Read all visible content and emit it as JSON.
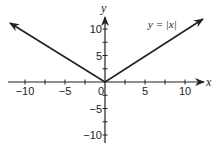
{
  "chart_data": {
    "type": "line",
    "title": "",
    "function_label": "y = |x|",
    "xlabel": "x",
    "ylabel": "y",
    "xlim": [
      -11.5,
      11.5
    ],
    "ylim": [
      -11,
      12.5
    ],
    "x_ticks": [
      -10,
      -7.5,
      -5,
      -2.5,
      0,
      2.5,
      5,
      7.5,
      10
    ],
    "y_ticks": [
      -10,
      -7.5,
      -5,
      -2.5,
      0,
      2.5,
      5,
      7.5,
      10
    ],
    "x_tick_labels": [
      {
        "value": -10,
        "label": "−10"
      },
      {
        "value": -5,
        "label": "−5"
      },
      {
        "value": 0,
        "label": "0"
      },
      {
        "value": 5,
        "label": "5"
      },
      {
        "value": 10,
        "label": "10"
      }
    ],
    "y_tick_labels": [
      {
        "value": 10,
        "label": "10"
      },
      {
        "value": 5,
        "label": "5"
      },
      {
        "value": -5,
        "label": "−5"
      },
      {
        "value": -10,
        "label": "−10"
      }
    ],
    "series": [
      {
        "name": "y = |x|",
        "x": [
          -12,
          0,
          12
        ],
        "y": [
          12,
          0,
          12
        ],
        "arrows": "both ends"
      }
    ],
    "grid": false,
    "legend": "none",
    "line_color": "#222222"
  }
}
